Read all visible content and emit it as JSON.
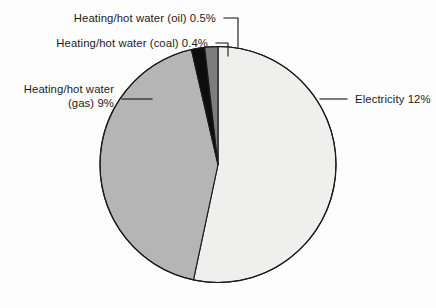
{
  "chart_data": {
    "type": "pie",
    "title": "",
    "subtitle": "",
    "xlabel": "",
    "ylabel": "",
    "legend_position": "none",
    "grid": false,
    "labels_position": "outside-with-leader-lines",
    "total_shown_percent": 21.9,
    "categories": [
      "Electricity",
      "Heating/hot water (gas)",
      "Heating/hot water (coal)",
      "Heating/hot water (oil)"
    ],
    "values": [
      12,
      9,
      0.4,
      0.5
    ],
    "value_labels": [
      "12%",
      "9%",
      "0.4%",
      "0.5%"
    ],
    "colors": [
      "#efefee",
      "#b5b5b5",
      "#0d0d0d",
      "#7d7d7d"
    ],
    "slices": [
      {
        "name": "electricity",
        "category": "Electricity",
        "value": 12,
        "value_label": "12%",
        "full_label": "Electricity 12%",
        "color": "#efefee",
        "start_angle_deg": 0,
        "end_angle_deg": 192
      },
      {
        "name": "heating-hot-water-gas",
        "category": "Heating/hot water (gas)",
        "value": 9,
        "value_label": "9%",
        "full_label": "Heating/hot water (gas) 9%",
        "color": "#b5b5b5",
        "start_angle_deg": 192,
        "end_angle_deg": 347
      },
      {
        "name": "heating-hot-water-coal",
        "category": "Heating/hot water (coal)",
        "value": 0.4,
        "value_label": "0.4%",
        "full_label": "Heating/hot water (coal) 0.4%",
        "color": "#0d0d0d",
        "start_angle_deg": 347,
        "end_angle_deg": 353.5
      },
      {
        "name": "heating-hot-water-oil",
        "category": "Heating/hot water (oil)",
        "value": 0.5,
        "value_label": "0.5%",
        "full_label": "Heating/hot water (oil) 0.5%",
        "color": "#7d7d7d",
        "start_angle_deg": 353.5,
        "end_angle_deg": 360
      }
    ]
  },
  "labels": {
    "oil": {
      "text": "Heating/hot water (oil) 0.5%",
      "line1": "Heating/hot water (oil) 0.5%"
    },
    "coal": {
      "text": "Heating/hot water (coal) 0.4%",
      "line1": "Heating/hot water (coal) 0.4%"
    },
    "gas": {
      "text": "Heating/hot water (gas) 9%",
      "line1": "Heating/hot water",
      "line2": "(gas) 9%"
    },
    "electricity": {
      "text": "Electricity 12%",
      "line1": "Electricity 12%"
    }
  },
  "style": {
    "background": "#fdfdfd",
    "outline": "#1a1a1a",
    "text_color": "#1b1b1b"
  }
}
